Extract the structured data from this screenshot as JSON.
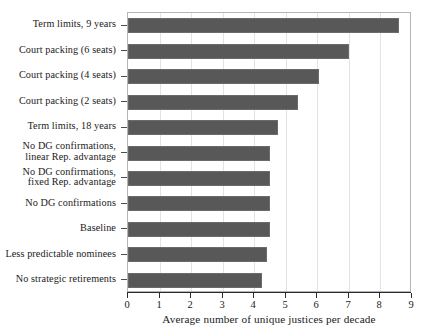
{
  "chart_data": {
    "type": "bar",
    "orientation": "horizontal",
    "title": "",
    "xlabel": "Average number of unique justices per decade",
    "ylabel": "",
    "xlim": [
      0,
      9
    ],
    "xticks": [
      "0",
      "1",
      "2",
      "3",
      "4",
      "5",
      "6",
      "7",
      "8",
      "9"
    ],
    "grid": true,
    "grid_axis": "x",
    "legend": null,
    "bar_color": "#585858",
    "categories": [
      "Term limits, 9 years",
      "Court packing (6 seats)",
      "Court packing (4 seats)",
      "Court packing (2 seats)",
      "Term limits, 18 years",
      "No DG confirmations,\nlinear Rep. advantage",
      "No DG confirmations,\nfixed Rep. advantage",
      "No DG confirmations",
      "Baseline",
      "Less predictable nominees",
      "No strategic retirements"
    ],
    "values": [
      8.6,
      7.0,
      6.05,
      5.4,
      4.75,
      4.5,
      4.5,
      4.5,
      4.5,
      4.4,
      4.25
    ]
  }
}
